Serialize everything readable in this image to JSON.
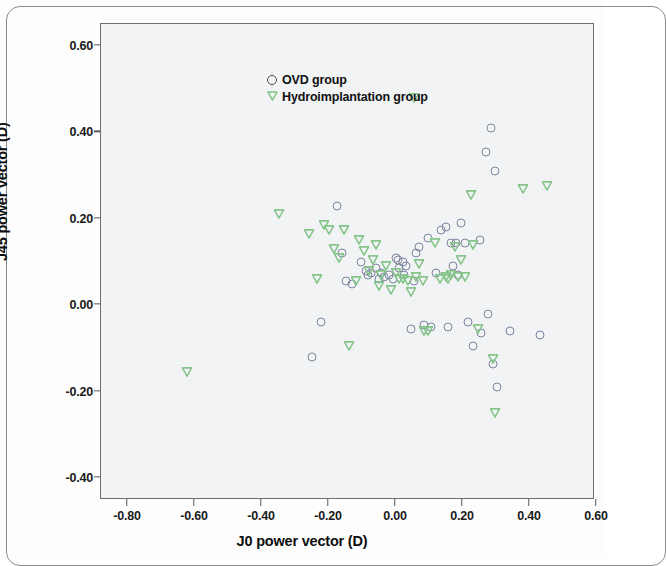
{
  "chart_data": {
    "type": "scatter",
    "title": "",
    "xlabel": "J0 power vector (D)",
    "ylabel": "J45 power vector (D)",
    "xlim": [
      -0.9,
      0.7
    ],
    "ylim": [
      -0.45,
      0.68
    ],
    "xticks": [
      "-0.80",
      "-0.60",
      "-0.40",
      "-0.20",
      "0.00",
      "0.20",
      "0.40",
      "0.60"
    ],
    "xtick_values": [
      -0.8,
      -0.6,
      -0.4,
      -0.2,
      0.0,
      0.2,
      0.4,
      0.6
    ],
    "yticks": [
      "0.60",
      "0.40",
      "0.20",
      "0.00",
      "-0.20",
      "-0.40"
    ],
    "ytick_values": [
      0.6,
      0.4,
      0.2,
      0.0,
      -0.2,
      -0.4
    ],
    "grid": false,
    "legend_position": "top-left-inside",
    "series": [
      {
        "name": "OVD group",
        "marker": "open-circle",
        "color": "#7d84a0",
        "points": [
          [
            -0.25,
            -0.12
          ],
          [
            -0.225,
            -0.04
          ],
          [
            -0.175,
            0.23
          ],
          [
            -0.16,
            0.12
          ],
          [
            -0.15,
            0.055
          ],
          [
            -0.13,
            0.05
          ],
          [
            -0.105,
            0.1
          ],
          [
            -0.09,
            0.08
          ],
          [
            -0.085,
            0.07
          ],
          [
            -0.075,
            0.075
          ],
          [
            -0.06,
            0.085
          ],
          [
            -0.05,
            0.06
          ],
          [
            -0.045,
            0.075
          ],
          [
            -0.035,
            0.065
          ],
          [
            -0.02,
            0.07
          ],
          [
            -0.01,
            0.06
          ],
          [
            0.0,
            0.11
          ],
          [
            0.005,
            0.105
          ],
          [
            0.01,
            0.085
          ],
          [
            0.02,
            0.1
          ],
          [
            0.025,
            0.07
          ],
          [
            0.03,
            0.09
          ],
          [
            0.045,
            -0.055
          ],
          [
            0.055,
            0.055
          ],
          [
            0.06,
            0.12
          ],
          [
            0.07,
            0.135
          ],
          [
            0.085,
            -0.045
          ],
          [
            0.095,
            0.155
          ],
          [
            0.105,
            -0.05
          ],
          [
            0.12,
            0.075
          ],
          [
            0.135,
            0.175
          ],
          [
            0.15,
            0.18
          ],
          [
            0.155,
            -0.05
          ],
          [
            0.165,
            0.145
          ],
          [
            0.17,
            0.09
          ],
          [
            0.18,
            0.145
          ],
          [
            0.185,
            0.07
          ],
          [
            0.195,
            0.19
          ],
          [
            0.205,
            0.145
          ],
          [
            0.215,
            -0.04
          ],
          [
            0.23,
            -0.095
          ],
          [
            0.25,
            0.15
          ],
          [
            0.255,
            -0.065
          ],
          [
            0.27,
            0.355
          ],
          [
            0.275,
            -0.02
          ],
          [
            0.285,
            0.41
          ],
          [
            0.29,
            -0.135
          ],
          [
            0.295,
            0.31
          ],
          [
            0.3,
            -0.19
          ],
          [
            0.34,
            -0.06
          ],
          [
            0.43,
            -0.07
          ]
        ]
      },
      {
        "name": "Hydroimplantation group",
        "marker": "open-triangle-down",
        "color": "#86c58a",
        "points": [
          [
            -0.625,
            -0.155
          ],
          [
            -0.35,
            0.21
          ],
          [
            -0.26,
            0.165
          ],
          [
            -0.235,
            0.06
          ],
          [
            -0.215,
            0.185
          ],
          [
            -0.2,
            0.175
          ],
          [
            -0.185,
            0.13
          ],
          [
            -0.17,
            0.11
          ],
          [
            -0.155,
            0.175
          ],
          [
            -0.14,
            -0.095
          ],
          [
            -0.12,
            0.055
          ],
          [
            -0.11,
            0.15
          ],
          [
            -0.095,
            0.125
          ],
          [
            -0.08,
            0.08
          ],
          [
            -0.07,
            0.105
          ],
          [
            -0.06,
            0.14
          ],
          [
            -0.05,
            0.045
          ],
          [
            -0.045,
            0.07
          ],
          [
            -0.03,
            0.09
          ],
          [
            -0.015,
            0.035
          ],
          [
            0.0,
            0.075
          ],
          [
            0.01,
            0.06
          ],
          [
            0.02,
            0.06
          ],
          [
            0.035,
            0.055
          ],
          [
            0.045,
            0.03
          ],
          [
            0.055,
            0.48
          ],
          [
            0.06,
            0.065
          ],
          [
            0.07,
            0.095
          ],
          [
            0.08,
            0.055
          ],
          [
            0.085,
            -0.06
          ],
          [
            0.095,
            -0.06
          ],
          [
            0.115,
            0.145
          ],
          [
            0.13,
            0.06
          ],
          [
            0.15,
            0.065
          ],
          [
            0.155,
            0.06
          ],
          [
            0.165,
            0.07
          ],
          [
            0.175,
            0.135
          ],
          [
            0.185,
            0.065
          ],
          [
            0.195,
            0.105
          ],
          [
            0.205,
            0.065
          ],
          [
            0.225,
            0.255
          ],
          [
            0.23,
            0.14
          ],
          [
            0.245,
            -0.055
          ],
          [
            0.29,
            -0.125
          ],
          [
            0.295,
            -0.25
          ],
          [
            0.38,
            0.27
          ],
          [
            0.45,
            0.275
          ]
        ]
      }
    ]
  },
  "legend": {
    "items": [
      {
        "label": "OVD group",
        "marker": "open-circle"
      },
      {
        "label": "Hydroimplantation group",
        "marker": "open-triangle-down"
      }
    ]
  },
  "axes": {
    "x_title": "J0 power vector (D)",
    "y_title": "J45 power vector (D)"
  },
  "colors": {
    "ovd_marker": "#7d84a0",
    "hydro_marker": "#86c58a",
    "plot_background": "#f2f3f5",
    "frame": "#6e6e72"
  }
}
